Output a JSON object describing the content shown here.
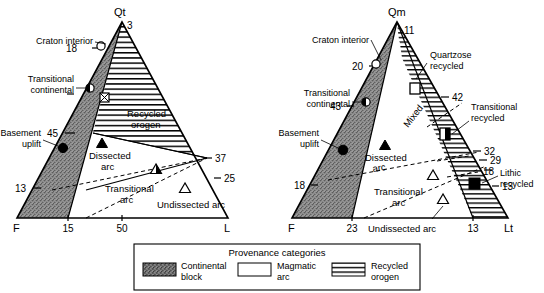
{
  "figure": {
    "panels": [
      {
        "id": "qt-f-l",
        "name": "Qt-F-L ternary diagram",
        "vertices": {
          "top": "Qt",
          "left": "F",
          "right": "L"
        },
        "apex_tick": "3",
        "left_axis_ticks": [
          "18",
          "45",
          "13"
        ],
        "base_ticks": [
          "15",
          "50"
        ],
        "right_axis_ticks": [
          "37",
          "25"
        ],
        "callouts": [
          {
            "label": "Craton interior",
            "symbol": "open-circle"
          },
          {
            "label": "Transitional\ncontinental",
            "symbol": "half-circle"
          },
          {
            "label": "Basement\nuplift",
            "symbol": "filled-circle"
          }
        ],
        "callout_lines": [
          {
            "label": "Craton interior"
          },
          {
            "label": "Transitional continental"
          },
          {
            "label": "Basement uplift"
          }
        ],
        "fields": [
          {
            "label": "Recycled\norogen",
            "fill": "hatch-horizontal"
          },
          {
            "label": "Dissected\narc",
            "fill": "none"
          },
          {
            "label": "Transitional\narc",
            "fill": "none"
          },
          {
            "label": "Undissected arc",
            "fill": "none"
          }
        ],
        "markers": [
          {
            "name": "recycled-orogen-marker",
            "symbol": "crossed-square"
          },
          {
            "name": "dissected-arc-marker",
            "symbol": "filled-triangle"
          },
          {
            "name": "transitional-arc-marker",
            "symbol": "half-triangle"
          },
          {
            "name": "undissected-arc-marker",
            "symbol": "open-triangle"
          }
        ]
      },
      {
        "id": "qm-f-lt",
        "name": "Qm-F-Lt ternary diagram",
        "vertices": {
          "top": "Qm",
          "left": "F",
          "right": "Lt"
        },
        "apex_tick": "11",
        "left_axis_ticks": [
          "20",
          "43",
          "18"
        ],
        "base_ticks": [
          "23",
          "13"
        ],
        "right_axis_ticks": [
          "42",
          "32",
          "29",
          "18",
          "13"
        ],
        "callouts": [
          {
            "label": "Craton interior",
            "symbol": "open-circle"
          },
          {
            "label": "Transitional\ncontinental",
            "symbol": "half-circle"
          },
          {
            "label": "Basement\nuplift",
            "symbol": "filled-circle"
          },
          {
            "label": "Quartzose\nrecycled",
            "symbol": "open-square"
          },
          {
            "label": "Transitional\nrecycled",
            "symbol": "half-square"
          },
          {
            "label": "Lithic\nrecycled",
            "symbol": "filled-square"
          }
        ],
        "fields": [
          {
            "label": "Mixed",
            "fill": "none"
          },
          {
            "label": "Dissected\narc",
            "fill": "none"
          },
          {
            "label": "Transitional\narc",
            "fill": "none"
          },
          {
            "label": "Undissected arc",
            "fill": "none"
          }
        ],
        "markers": [
          {
            "name": "dissected-arc-marker",
            "symbol": "filled-triangle"
          },
          {
            "name": "transitional-arc-marker",
            "symbol": "half-triangle"
          },
          {
            "name": "undissected-arc-marker",
            "symbol": "open-triangle"
          }
        ]
      }
    ]
  },
  "legend": {
    "title": "Provenance categories",
    "items": [
      {
        "label": "Continental\nblock",
        "label_line1": "Continental",
        "label_line2": "block",
        "swatch": "stipple-dark"
      },
      {
        "label": "Magmatic\narc",
        "label_line1": "Magmatic",
        "label_line2": "arc",
        "swatch": "white"
      },
      {
        "label": "Recycled\norogen",
        "label_line1": "Recycled",
        "label_line2": "orogen",
        "swatch": "hatch-horizontal"
      }
    ]
  },
  "text": {
    "left": {
      "apex": "Qt",
      "apex_num": "3",
      "t18": "18",
      "t45": "45",
      "t13": "13",
      "b15": "15",
      "b50": "50",
      "r37": "37",
      "r25": "25",
      "F": "F",
      "L": "L",
      "craton": "Craton interior",
      "trans_cont_1": "Transitional",
      "trans_cont_2": "continental",
      "basement_1": "Basement",
      "basement_2": "uplift",
      "recycled_1": "Recycled",
      "recycled_2": "orogen",
      "dissected_1": "Dissected",
      "dissected_2": "arc",
      "transarc_1": "Transitional",
      "transarc_2": "arc",
      "undissected": "Undissected arc"
    },
    "right": {
      "apex": "Qm",
      "apex_num": "11",
      "t20": "20",
      "t43": "43",
      "t18": "18",
      "b23": "23",
      "b13": "13",
      "r42": "42",
      "r32": "32",
      "r29": "29",
      "r18": "18",
      "r13": "13",
      "F": "F",
      "Lt": "Lt",
      "craton": "Craton interior",
      "trans_cont_1": "Transitional",
      "trans_cont_2": "continental",
      "basement_1": "Basement",
      "basement_2": "uplift",
      "quartzose_1": "Quartzose",
      "quartzose_2": "recycled",
      "transrec_1": "Transitional",
      "transrec_2": "recycled",
      "lithic_1": "Lithic",
      "lithic_2": "recycled",
      "mixed": "Mixed",
      "dissected_1": "Dissected",
      "dissected_2": "arc",
      "transarc_1": "Transitional",
      "transarc_2": "arc",
      "undissected": "Undissected arc"
    }
  },
  "colors": {
    "stroke": "#000000",
    "stipple": "#8d8d8d",
    "background": "#ffffff",
    "hatch": "#000000"
  }
}
